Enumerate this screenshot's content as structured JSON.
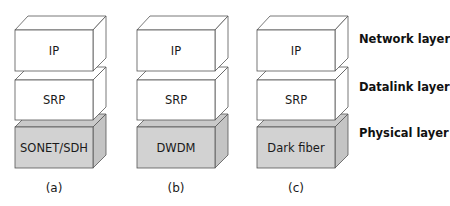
{
  "colors": {
    "white_face": "#ffffff",
    "white_top": "#ffffff",
    "white_side": "#ffffff",
    "gray_face": "#d2d2d2",
    "gray_top": "#c9c9c9",
    "gray_side": "#c4c4c4",
    "stroke": "#555555"
  },
  "stacks": [
    {
      "caption": "(a)",
      "layers": [
        {
          "label": "IP",
          "shaded": false
        },
        {
          "label": "SRP",
          "shaded": false
        },
        {
          "label": "SONET/SDH",
          "shaded": true
        }
      ]
    },
    {
      "caption": "(b)",
      "layers": [
        {
          "label": "IP",
          "shaded": false
        },
        {
          "label": "SRP",
          "shaded": false
        },
        {
          "label": "DWDM",
          "shaded": true
        }
      ]
    },
    {
      "caption": "(c)",
      "layers": [
        {
          "label": "IP",
          "shaded": false
        },
        {
          "label": "SRP",
          "shaded": false
        },
        {
          "label": "Dark fiber",
          "shaded": true
        }
      ]
    }
  ],
  "layer_names": [
    {
      "label": "Network layer"
    },
    {
      "label": "Datalink layer"
    },
    {
      "label": "Physical layer"
    }
  ]
}
